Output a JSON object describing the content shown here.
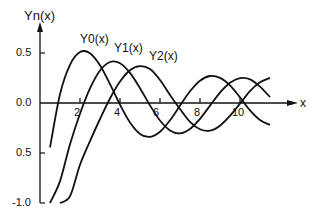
{
  "chart_data": {
    "type": "line",
    "title": "",
    "ylabel": "Yn(x)",
    "xlabel": "x",
    "xlim": [
      0,
      12
    ],
    "ylim": [
      -1.0,
      0.6
    ],
    "grid": false,
    "x_ticks": [
      "2",
      "4",
      "6",
      "8",
      "10"
    ],
    "y_ticks": [
      "0.5",
      "0.0",
      "0.5",
      "-1.0"
    ],
    "legend": "inline labels near curve peaks",
    "x": [
      0.5,
      1,
      1.5,
      2,
      2.5,
      3,
      3.5,
      4,
      4.5,
      5,
      5.5,
      6,
      6.5,
      7,
      7.5,
      8,
      8.5,
      9,
      9.5,
      10,
      10.5,
      11,
      11.5
    ],
    "series": [
      {
        "name": "Y0(x)",
        "values": [
          -0.445,
          0.088,
          0.382,
          0.51,
          0.498,
          0.377,
          0.189,
          -0.017,
          -0.195,
          -0.309,
          -0.339,
          -0.288,
          -0.173,
          -0.026,
          0.117,
          0.223,
          0.27,
          0.251,
          0.176,
          0.056,
          -0.073,
          -0.169,
          -0.219
        ]
      },
      {
        "name": "Y1(x)",
        "values": [
          -1.471,
          -0.781,
          -0.412,
          -0.107,
          0.146,
          0.325,
          0.41,
          0.398,
          0.301,
          0.148,
          -0.024,
          -0.175,
          -0.274,
          -0.303,
          -0.259,
          -0.158,
          -0.026,
          0.104,
          0.202,
          0.249,
          0.237,
          0.164,
          0.059
        ]
      },
      {
        "name": "Y2(x)",
        "values": [
          null,
          -1.651,
          -0.932,
          -0.617,
          -0.381,
          -0.16,
          0.045,
          0.215,
          0.328,
          0.368,
          0.339,
          0.23,
          0.081,
          -0.06,
          -0.189,
          -0.263,
          -0.277,
          -0.227,
          -0.128,
          -0.006,
          0.119,
          0.207,
          0.251
        ]
      }
    ]
  },
  "labels": {
    "y_axis": "Yn(x)",
    "x_axis": "x",
    "curve0": "Y0(x)",
    "curve1": "Y1(x)",
    "curve2": "Y2(x)",
    "ytick_pos": "0.5",
    "ytick_zero": "0.0",
    "ytick_neg": "0.5",
    "ytick_min": "-1.0",
    "xt2": "2",
    "xt4": "4",
    "xt6": "6",
    "xt8": "8",
    "xt10": "10"
  }
}
